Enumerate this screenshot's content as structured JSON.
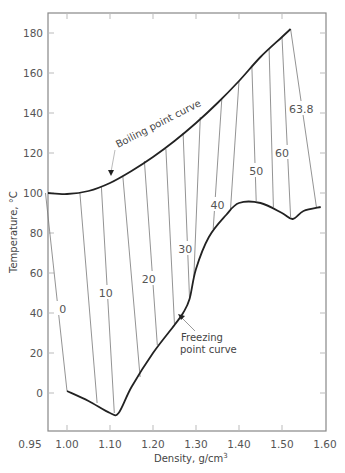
{
  "chart_data": {
    "type": "line",
    "title": "",
    "xlabel": "Density, g/cm",
    "xlabel_superscript": "3",
    "ylabel": "Temperature, °C",
    "xlim": [
      0.95,
      1.6
    ],
    "ylim": [
      -19,
      190
    ],
    "x_ticks": [
      0.95,
      1.0,
      1.1,
      1.2,
      1.3,
      1.4,
      1.5,
      1.6
    ],
    "x_tick_labels": [
      "0.95",
      "1.00",
      "1.10",
      "1.20",
      "1.30",
      "1.40",
      "1.50",
      "1.60"
    ],
    "y_ticks": [
      0,
      20,
      40,
      60,
      80,
      100,
      120,
      140,
      160,
      180
    ],
    "y_tick_labels": [
      "0",
      "20",
      "40",
      "60",
      "80",
      "100",
      "120",
      "140",
      "160",
      "180"
    ],
    "grid": false,
    "series": [
      {
        "name": "Boiling point curve",
        "x": [
          0.95,
          1.0,
          1.05,
          1.1,
          1.15,
          1.2,
          1.25,
          1.3,
          1.35,
          1.4,
          1.45,
          1.5,
          1.52
        ],
        "y": [
          100,
          99.5,
          101,
          105,
          111,
          118,
          126,
          135,
          145,
          156,
          168,
          178,
          182
        ]
      },
      {
        "name": "Freezing point curve",
        "x": [
          1.0,
          1.05,
          1.1,
          1.12,
          1.15,
          1.2,
          1.25,
          1.27,
          1.285,
          1.3,
          1.33,
          1.37,
          1.4,
          1.45,
          1.5,
          1.525,
          1.55,
          1.59
        ],
        "y": [
          1,
          -4,
          -10,
          -10,
          3,
          20,
          34,
          40,
          47,
          62,
          78,
          89,
          95,
          95,
          90,
          87,
          91,
          93
        ]
      }
    ],
    "isoconcentration_lines": [
      {
        "label": "0",
        "top": [
          0.95,
          100
        ],
        "bottom": [
          1.0,
          1
        ],
        "label_pos": [
          0.99,
          42
        ]
      },
      {
        "label": "",
        "top": [
          1.03,
          100
        ],
        "bottom": [
          1.07,
          -5
        ]
      },
      {
        "label": "10",
        "top": [
          1.08,
          103
        ],
        "bottom": [
          1.11,
          -10
        ],
        "label_pos": [
          1.09,
          50
        ]
      },
      {
        "label": "",
        "top": [
          1.13,
          108
        ],
        "bottom": [
          1.17,
          8
        ]
      },
      {
        "label": "20",
        "top": [
          1.18,
          116
        ],
        "bottom": [
          1.21,
          24
        ],
        "label_pos": [
          1.19,
          57
        ]
      },
      {
        "label": "",
        "top": [
          1.23,
          122
        ],
        "bottom": [
          1.25,
          34
        ]
      },
      {
        "label": "30",
        "top": [
          1.27,
          130
        ],
        "bottom": [
          1.285,
          47
        ],
        "label_pos": [
          1.275,
          72
        ]
      },
      {
        "label": "",
        "top": [
          1.31,
          138
        ],
        "bottom": [
          1.295,
          58
        ]
      },
      {
        "label": "40",
        "top": [
          1.36,
          147
        ],
        "bottom": [
          1.34,
          82
        ],
        "label_pos": [
          1.35,
          94
        ]
      },
      {
        "label": "",
        "top": [
          1.4,
          156
        ],
        "bottom": [
          1.38,
          91
        ]
      },
      {
        "label": "50",
        "top": [
          1.43,
          163
        ],
        "bottom": [
          1.44,
          96
        ],
        "label_pos": [
          1.44,
          111
        ]
      },
      {
        "label": "",
        "top": [
          1.47,
          172
        ],
        "bottom": [
          1.48,
          93
        ]
      },
      {
        "label": "60",
        "top": [
          1.5,
          178
        ],
        "bottom": [
          1.52,
          88
        ],
        "label_pos": [
          1.5,
          120
        ]
      },
      {
        "label": "63.8",
        "top": [
          1.52,
          182
        ],
        "bottom": [
          1.58,
          93
        ],
        "label_pos": [
          1.545,
          142
        ]
      }
    ],
    "annotations": [
      {
        "text": "Boiling point curve",
        "arrow_to": [
          1.1,
          105
        ]
      },
      {
        "text": "Freezing point curve",
        "arrow_to": [
          1.27,
          40
        ]
      }
    ]
  },
  "labels": {
    "boiling": "Boiling point curve",
    "freezing_line1": "Freezing",
    "freezing_line2": "point curve",
    "xlabel": "Density, g/cm",
    "xlabel_sup": "3",
    "ylabel": "Temperature, °C"
  },
  "colors": {
    "curve": "#222222",
    "iso_line": "#777777",
    "axis": "#888888",
    "text": "#555555"
  }
}
